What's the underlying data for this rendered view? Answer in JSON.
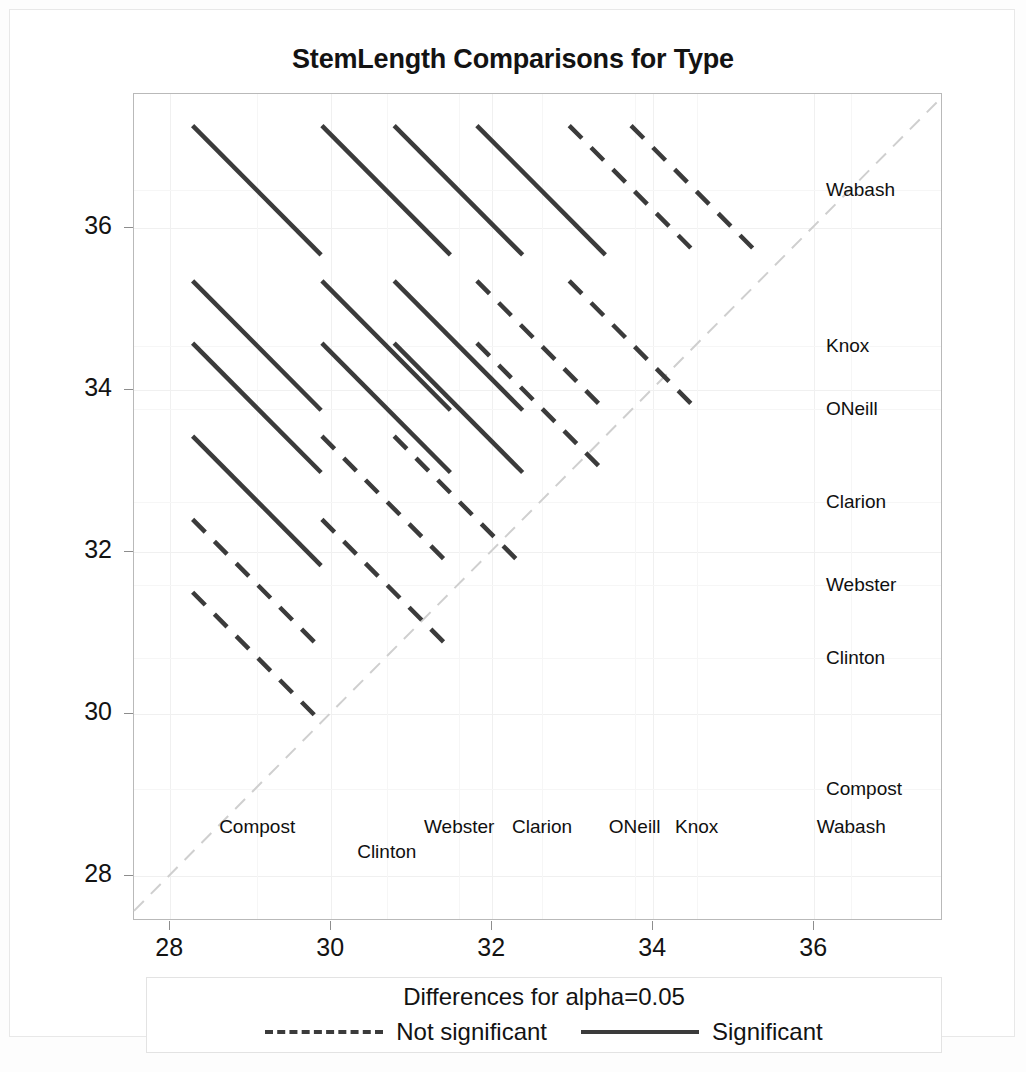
{
  "chart_data": {
    "type": "scatter",
    "title": "StemLength Comparisons for Type",
    "subtype": "diffogram-mean-mean-comparison-plot",
    "xlabel": "",
    "ylabel": "",
    "xlim": [
      27.55,
      37.6
    ],
    "ylim": [
      27.45,
      37.65
    ],
    "xticks": [
      28,
      30,
      32,
      34,
      36
    ],
    "yticks": [
      28,
      30,
      32,
      34,
      36
    ],
    "grid": true,
    "legend_position": "bottom",
    "groups": [
      {
        "name": "Compost",
        "mean": 29.08
      },
      {
        "name": "Clinton",
        "mean": 30.69
      },
      {
        "name": "Webster",
        "mean": 31.59
      },
      {
        "name": "Clarion",
        "mean": 32.62
      },
      {
        "name": "ONeill",
        "mean": 33.77
      },
      {
        "name": "Knox",
        "mean": 34.54
      },
      {
        "name": "Wabash",
        "mean": 36.46
      }
    ],
    "reference_line": {
      "label": "y = x identity line",
      "style": "dashed",
      "color": "#cfcfcf"
    },
    "comparisons": [
      {
        "group_x": "Compost",
        "group_y": "Clinton",
        "significant": false,
        "center_x": 29.08,
        "center_y": 30.69,
        "half_width": 0.8
      },
      {
        "group_x": "Compost",
        "group_y": "Webster",
        "significant": false,
        "center_x": 29.08,
        "center_y": 31.59,
        "half_width": 0.8
      },
      {
        "group_x": "Compost",
        "group_y": "Clarion",
        "significant": true,
        "center_x": 29.08,
        "center_y": 32.62,
        "half_width": 0.8
      },
      {
        "group_x": "Compost",
        "group_y": "ONeill",
        "significant": true,
        "center_x": 29.08,
        "center_y": 33.77,
        "half_width": 0.8
      },
      {
        "group_x": "Compost",
        "group_y": "Knox",
        "significant": true,
        "center_x": 29.08,
        "center_y": 34.54,
        "half_width": 0.8
      },
      {
        "group_x": "Compost",
        "group_y": "Wabash",
        "significant": true,
        "center_x": 29.08,
        "center_y": 36.46,
        "half_width": 0.8
      },
      {
        "group_x": "Clinton",
        "group_y": "Webster",
        "significant": false,
        "center_x": 30.69,
        "center_y": 31.59,
        "half_width": 0.8
      },
      {
        "group_x": "Clinton",
        "group_y": "Clarion",
        "significant": false,
        "center_x": 30.69,
        "center_y": 32.62,
        "half_width": 0.8
      },
      {
        "group_x": "Clinton",
        "group_y": "ONeill",
        "significant": true,
        "center_x": 30.69,
        "center_y": 33.77,
        "half_width": 0.8
      },
      {
        "group_x": "Clinton",
        "group_y": "Knox",
        "significant": true,
        "center_x": 30.69,
        "center_y": 34.54,
        "half_width": 0.8
      },
      {
        "group_x": "Clinton",
        "group_y": "Wabash",
        "significant": true,
        "center_x": 30.69,
        "center_y": 36.46,
        "half_width": 0.8
      },
      {
        "group_x": "Webster",
        "group_y": "Clarion",
        "significant": false,
        "center_x": 31.59,
        "center_y": 32.62,
        "half_width": 0.8
      },
      {
        "group_x": "Webster",
        "group_y": "ONeill",
        "significant": true,
        "center_x": 31.59,
        "center_y": 33.77,
        "half_width": 0.8
      },
      {
        "group_x": "Webster",
        "group_y": "Knox",
        "significant": true,
        "center_x": 31.59,
        "center_y": 34.54,
        "half_width": 0.8
      },
      {
        "group_x": "Webster",
        "group_y": "Wabash",
        "significant": true,
        "center_x": 31.59,
        "center_y": 36.46,
        "half_width": 0.8
      },
      {
        "group_x": "Clarion",
        "group_y": "ONeill",
        "significant": false,
        "center_x": 32.62,
        "center_y": 33.77,
        "half_width": 0.8
      },
      {
        "group_x": "Clarion",
        "group_y": "Knox",
        "significant": false,
        "center_x": 32.62,
        "center_y": 34.54,
        "half_width": 0.8
      },
      {
        "group_x": "Clarion",
        "group_y": "Wabash",
        "significant": true,
        "center_x": 32.62,
        "center_y": 36.46,
        "half_width": 0.8
      },
      {
        "group_x": "ONeill",
        "group_y": "Knox",
        "significant": false,
        "center_x": 33.77,
        "center_y": 34.54,
        "half_width": 0.8
      },
      {
        "group_x": "ONeill",
        "group_y": "Wabash",
        "significant": false,
        "center_x": 33.77,
        "center_y": 36.46,
        "half_width": 0.8
      },
      {
        "group_x": "Knox",
        "group_y": "Wabash",
        "significant": false,
        "center_x": 34.54,
        "center_y": 36.46,
        "half_width": 0.8
      }
    ],
    "legend": {
      "title": "Differences for alpha=0.05",
      "entries": [
        {
          "label": "Not significant",
          "style": "dashed"
        },
        {
          "label": "Significant",
          "style": "solid"
        }
      ]
    },
    "colors": {
      "significant": "#3b3b3b",
      "not_significant": "#3b3b3b",
      "grid": "#f0f0f0",
      "frame": "#b9b9b9",
      "reference": "#cfcfcf",
      "text": "#131313"
    }
  },
  "axis": {
    "x_tick_labels": [
      "28",
      "30",
      "32",
      "34",
      "36"
    ],
    "y_tick_labels": [
      "28",
      "30",
      "32",
      "34",
      "36"
    ]
  },
  "right_labels": [
    "Wabash",
    "Knox",
    "ONeill",
    "Clarion",
    "Webster",
    "Clinton",
    "Compost"
  ],
  "bottom_labels": [
    "Compost",
    "Clinton",
    "Webster",
    "Clarion",
    "ONeill",
    "Knox",
    "Wabash"
  ]
}
